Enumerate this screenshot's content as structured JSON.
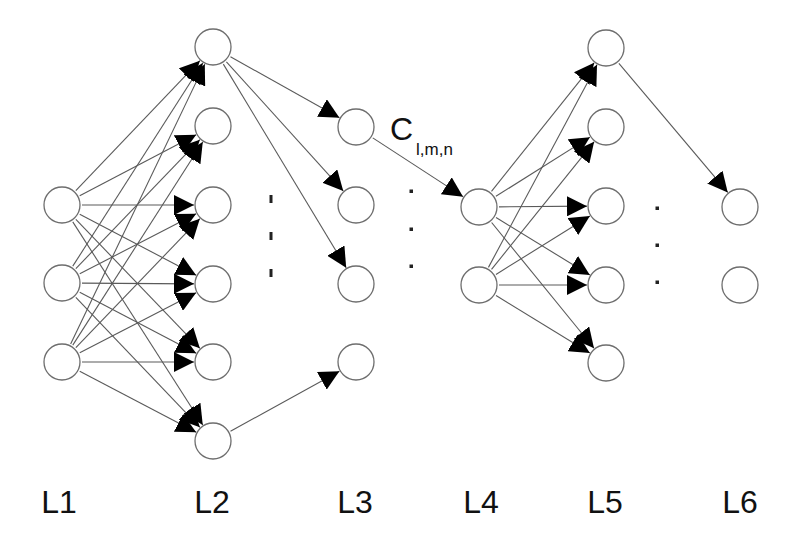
{
  "diagram": {
    "type": "neural-network-layers",
    "node_radius": 18,
    "colors": {
      "background": "#ffffff",
      "node_stroke": "#6e6e6e",
      "edge": "#5a5a5a",
      "arrowhead": "#000000",
      "text": "#111111"
    },
    "layers": [
      {
        "id": "L1",
        "label": "L1",
        "x": 62,
        "label_x": 59,
        "nodes_y": [
          205,
          283,
          362
        ]
      },
      {
        "id": "L2",
        "label": "L2",
        "x": 213,
        "label_x": 212,
        "nodes_y": [
          47,
          126,
          205,
          284,
          362,
          441
        ]
      },
      {
        "id": "L3",
        "label": "L3",
        "x": 356,
        "label_x": 355,
        "nodes_y": [
          127,
          205,
          284,
          362
        ]
      },
      {
        "id": "L4",
        "label": "L4",
        "x": 479,
        "label_x": 481,
        "nodes_y": [
          207,
          285
        ]
      },
      {
        "id": "L5",
        "label": "L5",
        "x": 606,
        "label_x": 605,
        "nodes_y": [
          48,
          127,
          206,
          285,
          363
        ]
      },
      {
        "id": "L6",
        "label": "L6",
        "x": 740,
        "label_x": 740,
        "nodes_y": [
          207,
          285
        ]
      }
    ],
    "label_baseline_y": 513,
    "edges": [
      {
        "from": [
          "L1",
          0
        ],
        "to": [
          "L2",
          0
        ]
      },
      {
        "from": [
          "L1",
          0
        ],
        "to": [
          "L2",
          1
        ]
      },
      {
        "from": [
          "L1",
          0
        ],
        "to": [
          "L2",
          2
        ]
      },
      {
        "from": [
          "L1",
          0
        ],
        "to": [
          "L2",
          3
        ]
      },
      {
        "from": [
          "L1",
          0
        ],
        "to": [
          "L2",
          4
        ]
      },
      {
        "from": [
          "L1",
          0
        ],
        "to": [
          "L2",
          5
        ]
      },
      {
        "from": [
          "L1",
          1
        ],
        "to": [
          "L2",
          0
        ]
      },
      {
        "from": [
          "L1",
          1
        ],
        "to": [
          "L2",
          1
        ]
      },
      {
        "from": [
          "L1",
          1
        ],
        "to": [
          "L2",
          2
        ]
      },
      {
        "from": [
          "L1",
          1
        ],
        "to": [
          "L2",
          3
        ]
      },
      {
        "from": [
          "L1",
          1
        ],
        "to": [
          "L2",
          4
        ]
      },
      {
        "from": [
          "L1",
          1
        ],
        "to": [
          "L2",
          5
        ]
      },
      {
        "from": [
          "L1",
          2
        ],
        "to": [
          "L2",
          0
        ]
      },
      {
        "from": [
          "L1",
          2
        ],
        "to": [
          "L2",
          1
        ]
      },
      {
        "from": [
          "L1",
          2
        ],
        "to": [
          "L2",
          2
        ]
      },
      {
        "from": [
          "L1",
          2
        ],
        "to": [
          "L2",
          3
        ]
      },
      {
        "from": [
          "L1",
          2
        ],
        "to": [
          "L2",
          4
        ]
      },
      {
        "from": [
          "L1",
          2
        ],
        "to": [
          "L2",
          5
        ]
      },
      {
        "from": [
          "L2",
          0
        ],
        "to": [
          "L3",
          0
        ]
      },
      {
        "from": [
          "L2",
          0
        ],
        "to": [
          "L3",
          1
        ]
      },
      {
        "from": [
          "L2",
          0
        ],
        "to": [
          "L3",
          2
        ]
      },
      {
        "from": [
          "L2",
          5
        ],
        "to": [
          "L3",
          3
        ]
      },
      {
        "from": [
          "L3",
          0
        ],
        "to": [
          "L4",
          0
        ]
      },
      {
        "from": [
          "L4",
          0
        ],
        "to": [
          "L5",
          0
        ]
      },
      {
        "from": [
          "L4",
          0
        ],
        "to": [
          "L5",
          1
        ]
      },
      {
        "from": [
          "L4",
          0
        ],
        "to": [
          "L5",
          2
        ]
      },
      {
        "from": [
          "L4",
          0
        ],
        "to": [
          "L5",
          3
        ]
      },
      {
        "from": [
          "L4",
          0
        ],
        "to": [
          "L5",
          4
        ]
      },
      {
        "from": [
          "L4",
          1
        ],
        "to": [
          "L5",
          0
        ]
      },
      {
        "from": [
          "L4",
          1
        ],
        "to": [
          "L5",
          1
        ]
      },
      {
        "from": [
          "L4",
          1
        ],
        "to": [
          "L5",
          2
        ]
      },
      {
        "from": [
          "L4",
          1
        ],
        "to": [
          "L5",
          3
        ]
      },
      {
        "from": [
          "L4",
          1
        ],
        "to": [
          "L5",
          4
        ]
      },
      {
        "from": [
          "L5",
          0
        ],
        "to": [
          "L6",
          0
        ]
      }
    ],
    "edge_label": {
      "main": "C",
      "subscript": "l,m,n",
      "x": 390,
      "y": 140,
      "edge_ref": "L3[0]->L4[0]"
    },
    "ellipses": [
      {
        "between": "L2-L3",
        "x": 271,
        "ys": [
          199,
          236,
          273
        ],
        "shape": "tick"
      },
      {
        "between": "L3-L4",
        "x": 411,
        "ys": [
          191,
          229,
          266
        ],
        "shape": "dot"
      },
      {
        "between": "L5-L6",
        "x": 657,
        "ys": [
          208,
          245,
          282
        ],
        "shape": "dot"
      }
    ]
  }
}
